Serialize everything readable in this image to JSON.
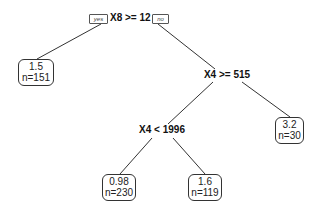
{
  "diagram": {
    "type": "regression-tree",
    "root": {
      "split": "X8 >= 12",
      "left_branch_tag": "yes",
      "right_branch_tag": "no"
    },
    "nodes": {
      "n1": {
        "kind": "split",
        "label": "X8 >= 12"
      },
      "n2": {
        "kind": "leaf",
        "value": "1.5",
        "count": "n=151"
      },
      "n3": {
        "kind": "split",
        "label": "X4 >= 515"
      },
      "n4": {
        "kind": "split",
        "label": "X4 < 1996"
      },
      "n5": {
        "kind": "leaf",
        "value": "3.2",
        "count": "n=30"
      },
      "n6": {
        "kind": "leaf",
        "value": "0.98",
        "count": "n=230"
      },
      "n7": {
        "kind": "leaf",
        "value": "1.6",
        "count": "n=119"
      }
    },
    "edges": [
      {
        "from": "n1",
        "to": "n2",
        "branch": "yes"
      },
      {
        "from": "n1",
        "to": "n3",
        "branch": "no"
      },
      {
        "from": "n3",
        "to": "n4",
        "branch": "yes"
      },
      {
        "from": "n3",
        "to": "n5",
        "branch": "no"
      },
      {
        "from": "n4",
        "to": "n6",
        "branch": "yes"
      },
      {
        "from": "n4",
        "to": "n7",
        "branch": "no"
      }
    ],
    "colors": {
      "edge": "#333333",
      "leaf_border": "#333333",
      "text": "#111111"
    }
  }
}
